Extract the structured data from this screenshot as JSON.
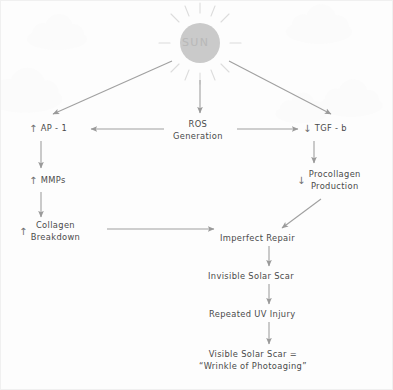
{
  "diagram": {
    "title_element": "sun",
    "background_color": "#fdfdfd",
    "ink_color": "#8c8c8c",
    "text_color": "#4a4a4a",
    "sun": {
      "label": "SUN",
      "disc_color": "#c9c9c9",
      "ray_color": "#d8d8d8",
      "cx": 199,
      "cy": 42,
      "r": 20
    },
    "clouds": [
      {
        "name": "cloud-top-left",
        "x": 56,
        "y": 30,
        "scale": 1.0
      },
      {
        "name": "cloud-left",
        "x": 24,
        "y": 88,
        "scale": 1.25
      },
      {
        "name": "cloud-top-right",
        "x": 318,
        "y": 22,
        "scale": 1.1
      },
      {
        "name": "cloud-right",
        "x": 350,
        "y": 96,
        "scale": 1.05
      },
      {
        "name": "cloud-mid-right",
        "x": 300,
        "y": 106,
        "scale": 0.85
      }
    ],
    "nodes": [
      {
        "id": "ap1",
        "name": "node-ap-1",
        "marker": "↑",
        "marker_meaning": "increase",
        "lines": [
          "AP - 1"
        ],
        "x": 28,
        "y": 122
      },
      {
        "id": "ros",
        "name": "node-ros-generation",
        "marker": "",
        "marker_meaning": "",
        "lines": [
          "ROS",
          "Generation"
        ],
        "x": 172,
        "y": 118
      },
      {
        "id": "tgfb",
        "name": "node-tgf-b",
        "marker": "↓",
        "marker_meaning": "decrease",
        "lines": [
          "TGF - b"
        ],
        "x": 302,
        "y": 122
      },
      {
        "id": "mmps",
        "name": "node-mmps",
        "marker": "↑",
        "marker_meaning": "increase",
        "lines": [
          "MMPs"
        ],
        "x": 28,
        "y": 174
      },
      {
        "id": "procollagen",
        "name": "node-procollagen-production",
        "marker": "↓",
        "marker_meaning": "decrease",
        "lines": [
          "Procollagen",
          "Production"
        ],
        "x": 296,
        "y": 168
      },
      {
        "id": "collagen",
        "name": "node-collagen-breakdown",
        "marker": "↑",
        "marker_meaning": "increase",
        "lines": [
          "Collagen",
          "Breakdown"
        ],
        "x": 18,
        "y": 219
      },
      {
        "id": "repair",
        "name": "node-imperfect-repair",
        "marker": "",
        "marker_meaning": "",
        "lines": [
          "Imperfect Repair"
        ],
        "x": 219,
        "y": 232
      },
      {
        "id": "invisible",
        "name": "node-invisible-solar-scar",
        "marker": "",
        "marker_meaning": "",
        "lines": [
          "Invisible Solar Scar"
        ],
        "x": 207,
        "y": 270
      },
      {
        "id": "repeated",
        "name": "node-repeated-uv-injury",
        "marker": "",
        "marker_meaning": "",
        "lines": [
          "Repeated UV Injury"
        ],
        "x": 208,
        "y": 308
      },
      {
        "id": "visible",
        "name": "node-visible-solar-scar",
        "marker": "",
        "marker_meaning": "",
        "lines": [
          "Visible Solar Scar =",
          "“Wrinkle of Photoaging”"
        ],
        "x": 198,
        "y": 348
      }
    ],
    "edges": [
      {
        "name": "edge-sun-to-ap1",
        "from": "sun",
        "to": "ap1",
        "kind": "diagonal-arrow"
      },
      {
        "name": "edge-sun-to-ros",
        "from": "sun",
        "to": "ros",
        "kind": "vertical-arrow"
      },
      {
        "name": "edge-sun-to-tgfb",
        "from": "sun",
        "to": "tgfb",
        "kind": "diagonal-arrow"
      },
      {
        "name": "edge-ros-to-ap1",
        "from": "ros",
        "to": "ap1",
        "kind": "horizontal-arrow-left"
      },
      {
        "name": "edge-ros-to-tgfb",
        "from": "ros",
        "to": "tgfb",
        "kind": "horizontal-arrow-right"
      },
      {
        "name": "edge-ap1-to-mmps",
        "from": "ap1",
        "to": "mmps",
        "kind": "vertical-arrow"
      },
      {
        "name": "edge-mmps-to-collagen",
        "from": "mmps",
        "to": "collagen",
        "kind": "vertical-arrow"
      },
      {
        "name": "edge-tgfb-to-procollagen",
        "from": "tgfb",
        "to": "procollagen",
        "kind": "vertical-arrow"
      },
      {
        "name": "edge-collagen-to-repair",
        "from": "collagen",
        "to": "repair",
        "kind": "horizontal-arrow-right"
      },
      {
        "name": "edge-procollagen-to-repair",
        "from": "procollagen",
        "to": "repair",
        "kind": "diagonal-arrow"
      },
      {
        "name": "edge-repair-to-invisible",
        "from": "repair",
        "to": "invisible",
        "kind": "vertical-arrow"
      },
      {
        "name": "edge-invisible-to-repeated",
        "from": "invisible",
        "to": "repeated",
        "kind": "vertical-arrow"
      },
      {
        "name": "edge-repeated-to-visible",
        "from": "repeated",
        "to": "visible",
        "kind": "vertical-arrow"
      }
    ]
  }
}
